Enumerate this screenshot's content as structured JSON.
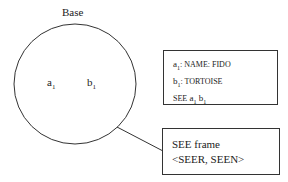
{
  "diagram": {
    "base_label": "Base",
    "circle_elements": [
      {
        "name": "a",
        "sub": "1"
      },
      {
        "name": "b",
        "sub": "1"
      }
    ],
    "info_box": {
      "lines": [
        {
          "var": "a",
          "sub": "1",
          "text": ": NAME: FIDO"
        },
        {
          "var": "b",
          "sub": "1",
          "text": ": TORTOISE"
        },
        {
          "prefix": "SEE",
          "args": [
            {
              "var": "a",
              "sub": "1"
            },
            {
              "var": "b",
              "sub": "1"
            }
          ]
        }
      ]
    },
    "frame_box": {
      "title": "SEE frame",
      "roles": "<SEER, SEEN>"
    }
  }
}
